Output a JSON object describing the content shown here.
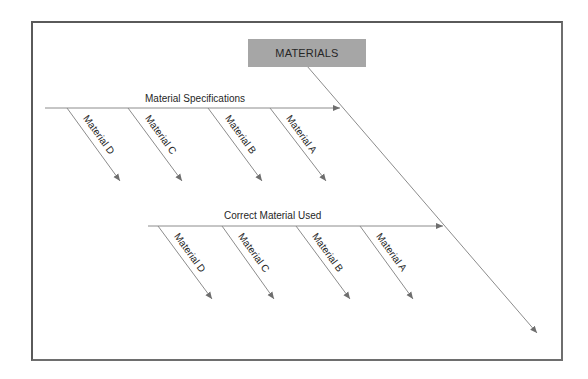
{
  "diagram": {
    "type": "fishbone",
    "head": {
      "label": "MATERIALS",
      "fill": "#a6a6a6"
    },
    "line_color": "#8c8c8c",
    "branches": [
      {
        "label": "Material Specifications",
        "causes": [
          "Material D",
          "Material C",
          "Material B",
          "Material A"
        ]
      },
      {
        "label": "Correct Material Used",
        "causes": [
          "Material D",
          "Material C",
          "Material B",
          "Material A"
        ]
      }
    ]
  }
}
